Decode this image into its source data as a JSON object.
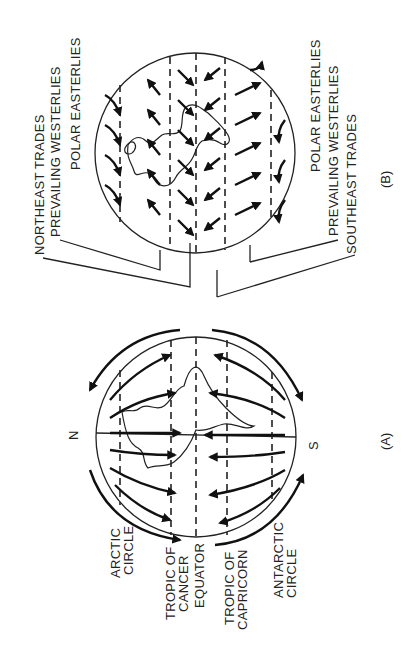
{
  "figure": {
    "orientation": "rotated 90 degrees counter-clockwise",
    "panel_a": {
      "caption": "(A)",
      "poles": {
        "north": "N",
        "south": "S"
      },
      "labels": [
        "ARCTIC",
        "CIRCLE",
        "TROPIC OF",
        "CANCER",
        "EQUATOR",
        "TROPIC OF",
        "CAPRICORN",
        "ANTARCTIC",
        "CIRCLE"
      ],
      "label_items": {
        "arctic_1": "ARCTIC",
        "arctic_2": "CIRCLE",
        "cancer_1": "TROPIC OF",
        "cancer_2": "CANCER",
        "equator": "EQUATOR",
        "capricorn_1": "TROPIC OF",
        "capricorn_2": "CAPRICORN",
        "antarctic_1": "ANTARCTIC",
        "antarctic_2": "CIRCLE"
      }
    },
    "panel_b": {
      "caption": "(B)",
      "labels_left": {
        "northeast_trades": "NORTHEAST TRADES",
        "prevailing_westerlies": "PREVAILING WESTERLIES",
        "polar_easterlies": "POLAR EASTERLIES"
      },
      "labels_right": {
        "polar_easterlies": "POLAR EASTERLIES",
        "prevailing_westerlies": "PREVAILING WESTERLIES",
        "southeast_trades": "SOUTHEAST TRADES"
      }
    }
  }
}
